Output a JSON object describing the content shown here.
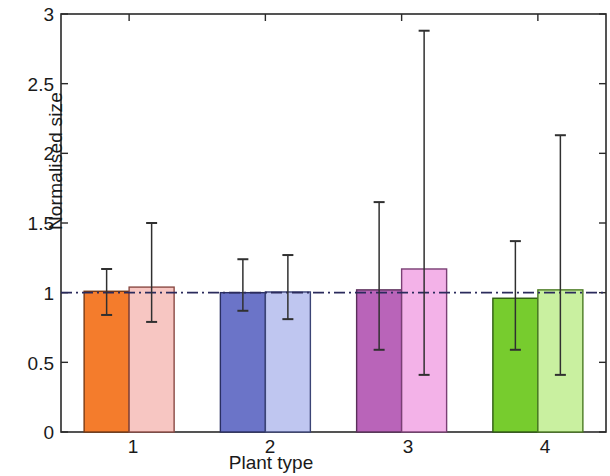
{
  "chart_data": {
    "type": "bar",
    "title": "",
    "xlabel": "Plant type",
    "ylabel": "Normalised size",
    "categories": [
      "1",
      "2",
      "3",
      "4"
    ],
    "xtick_labels": [
      "1",
      "2",
      "3",
      "4"
    ],
    "ytick_labels": [
      "0",
      "0.5",
      "1",
      "1.5",
      "2",
      "2.5",
      "3"
    ],
    "ytick_values": [
      0,
      0.5,
      1,
      1.5,
      2,
      2.5,
      3
    ],
    "ylim": [
      0,
      3
    ],
    "grid": false,
    "legend": "none",
    "reference_line": {
      "value": 1,
      "style": "dash-dot",
      "color": "#2b2b5c"
    },
    "series": [
      {
        "name": "bar-a",
        "values": [
          1.01,
          1.0,
          1.02,
          0.96
        ],
        "err_upper": [
          1.17,
          1.24,
          1.65,
          1.37
        ],
        "err_lower": [
          0.84,
          0.87,
          0.59,
          0.59
        ],
        "colors": [
          "#F47C2C",
          "#6B74C8",
          "#B964B9",
          "#77CC2E"
        ],
        "edge_colors": [
          "#7a3a12",
          "#2a2f63",
          "#5a2f5a",
          "#2f5c12"
        ]
      },
      {
        "name": "bar-b",
        "values": [
          1.04,
          1.005,
          1.17,
          1.02
        ],
        "err_upper": [
          1.5,
          1.27,
          2.88,
          2.13
        ],
        "err_lower": [
          0.79,
          0.81,
          0.41,
          0.41
        ],
        "colors": [
          "#F7C6C2",
          "#BFC6F0",
          "#F3B2E8",
          "#C9F0A0"
        ],
        "edge_colors": [
          "#8a4a44",
          "#3b4475",
          "#7a3f74",
          "#4a7a22"
        ]
      }
    ]
  },
  "axes": {
    "error_bar_color": "#303030",
    "axis_color": "#2a2a2a",
    "background": "#ffffff"
  }
}
